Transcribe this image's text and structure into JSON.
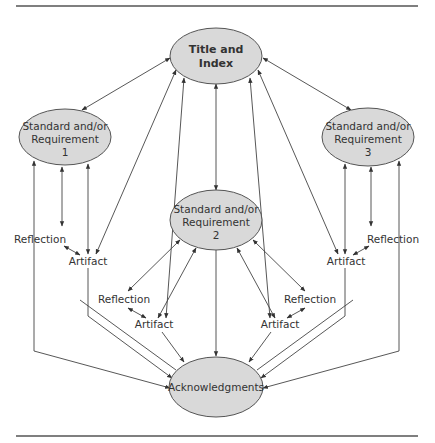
{
  "diagram": {
    "nodes": {
      "title": {
        "lines": [
          "Title and",
          "Index"
        ],
        "bold": true
      },
      "standard1": {
        "lines": [
          "Standard and/or",
          "Requirement",
          "1"
        ]
      },
      "standard2": {
        "lines": [
          "Standard and/or",
          "Requirement",
          "2"
        ]
      },
      "standard3": {
        "lines": [
          "Standard and/or",
          "Requirement",
          "3"
        ]
      },
      "acknowledgments": {
        "lines": [
          "Acknowledgments"
        ]
      }
    },
    "labels": {
      "reflection_1": "Reflection",
      "artifact_1": "Artifact",
      "reflection_2a": "Reflection",
      "artifact_2a": "Artifact",
      "reflection_2b": "Reflection",
      "artifact_2b": "Artifact",
      "reflection_3": "Reflection",
      "artifact_3": "Artifact"
    },
    "colors": {
      "ellipse_fill": "#d9d9d9",
      "ellipse_stroke": "#555555",
      "line": "#444444",
      "text": "#333333"
    }
  }
}
